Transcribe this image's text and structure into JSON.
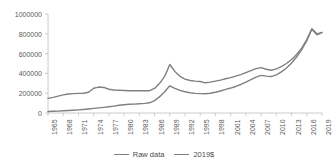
{
  "chart_data": {
    "type": "line",
    "title": "",
    "subtitle": "",
    "xlabel": "",
    "ylabel": "",
    "grid": false,
    "legend_position": "bottom",
    "xlim": [
      1965,
      2019
    ],
    "ylim": [
      0,
      1000000
    ],
    "y_ticks": [
      0,
      200000,
      400000,
      600000,
      800000,
      1000000
    ],
    "y_tick_labels": [
      "0",
      "200000",
      "400000",
      "600000",
      "800000",
      "1000000"
    ],
    "x_ticks": [
      1965,
      1968,
      1971,
      1974,
      1977,
      1980,
      1983,
      1986,
      1989,
      1992,
      1995,
      1998,
      2001,
      2004,
      2007,
      2010,
      2013,
      2016,
      2019
    ],
    "x_tick_labels": [
      "1965",
      "1968",
      "1971",
      "1974",
      "1977",
      "1980",
      "1983",
      "1986",
      "1989",
      "1992",
      "1995",
      "1998",
      "2001",
      "2004",
      "2007",
      "2010",
      "2013",
      "2016",
      "2019"
    ],
    "x": [
      1965,
      1966,
      1967,
      1968,
      1969,
      1970,
      1971,
      1972,
      1973,
      1974,
      1975,
      1976,
      1977,
      1978,
      1979,
      1980,
      1981,
      1982,
      1983,
      1984,
      1985,
      1986,
      1987,
      1988,
      1989,
      1990,
      1991,
      1992,
      1993,
      1994,
      1995,
      1996,
      1997,
      1998,
      1999,
      2000,
      2001,
      2002,
      2003,
      2004,
      2005,
      2006,
      2007,
      2008,
      2009,
      2010,
      2011,
      2012,
      2013,
      2014,
      2015,
      2016,
      2017,
      2018,
      2019
    ],
    "series": [
      {
        "name": "Raw data",
        "color": "#808080",
        "values": [
          15000,
          17000,
          19000,
          22000,
          25000,
          28000,
          32000,
          36000,
          41000,
          47000,
          52000,
          57000,
          63000,
          70000,
          78000,
          84000,
          88000,
          90000,
          93000,
          97000,
          103000,
          125000,
          165000,
          215000,
          275000,
          248000,
          228000,
          215000,
          205000,
          198000,
          196000,
          195000,
          200000,
          210000,
          222000,
          238000,
          252000,
          268000,
          288000,
          312000,
          338000,
          362000,
          380000,
          372000,
          368000,
          385000,
          415000,
          455000,
          505000,
          565000,
          640000,
          730000,
          845000,
          790000,
          812000
        ]
      },
      {
        "name": "2019$",
        "color": "#808080",
        "values": [
          148000,
          158000,
          170000,
          183000,
          192000,
          196000,
          198000,
          200000,
          210000,
          250000,
          262000,
          258000,
          240000,
          232000,
          230000,
          228000,
          225000,
          224000,
          226000,
          224000,
          225000,
          248000,
          300000,
          370000,
          490000,
          420000,
          370000,
          342000,
          328000,
          322000,
          318000,
          305000,
          312000,
          322000,
          332000,
          346000,
          358000,
          372000,
          388000,
          408000,
          428000,
          448000,
          458000,
          442000,
          432000,
          446000,
          468000,
          500000,
          540000,
          592000,
          655000,
          742000,
          850000,
          800000,
          815000
        ]
      }
    ]
  },
  "legend": {
    "entries": [
      {
        "label": "Raw data"
      },
      {
        "label": "2019$"
      }
    ]
  },
  "colors": {
    "line": "#808080",
    "axis": "#bfbfbf",
    "tick_text": "#5a5a5a"
  }
}
